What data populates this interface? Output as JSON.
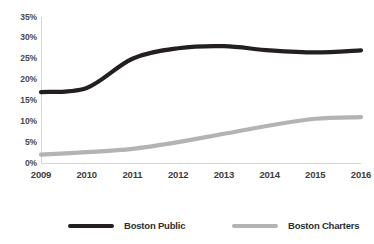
{
  "chart_data": {
    "type": "line",
    "title": "",
    "xlabel": "",
    "ylabel": "",
    "x": [
      2009,
      2010,
      2011,
      2012,
      2013,
      2014,
      2015,
      2016
    ],
    "categories": [
      "2009",
      "2010",
      "2011",
      "2012",
      "2013",
      "2014",
      "2015",
      "2016"
    ],
    "series": [
      {
        "name": "Boston Public",
        "color": "#231f20",
        "values": [
          17,
          18,
          25,
          27.5,
          28,
          27,
          26.5,
          27
        ]
      },
      {
        "name": "Boston Charters",
        "color": "#b3b3b3",
        "values": [
          2,
          2.6,
          3.4,
          5,
          7,
          9,
          10.6,
          11
        ]
      }
    ],
    "ylim": [
      0,
      35
    ],
    "ytick_values": [
      0,
      5,
      10,
      15,
      20,
      25,
      30,
      35
    ],
    "ytick_labels": [
      "0%",
      "5%",
      "10%",
      "15%",
      "20%",
      "25%",
      "30%",
      "35%"
    ],
    "xlim": [
      2009,
      2016
    ],
    "grid": false,
    "legend_position": "bottom"
  },
  "axes": {
    "y_ticks": [
      {
        "label": "35%",
        "value": 35
      },
      {
        "label": "30%",
        "value": 30
      },
      {
        "label": "25%",
        "value": 25
      },
      {
        "label": "20%",
        "value": 20
      },
      {
        "label": "15%",
        "value": 15
      },
      {
        "label": "10%",
        "value": 10
      },
      {
        "label": "5%",
        "value": 5
      },
      {
        "label": "0%",
        "value": 0
      }
    ],
    "x_ticks": [
      {
        "label": "2009",
        "value": 2009
      },
      {
        "label": "2010",
        "value": 2010
      },
      {
        "label": "2011",
        "value": 2011
      },
      {
        "label": "2012",
        "value": 2012
      },
      {
        "label": "2013",
        "value": 2013
      },
      {
        "label": "2014",
        "value": 2014
      },
      {
        "label": "2015",
        "value": 2015
      },
      {
        "label": "2016",
        "value": 2016
      }
    ]
  },
  "legend": {
    "entries": [
      {
        "label": "Boston Public",
        "color": "#231f20"
      },
      {
        "label": "Boston Charters",
        "color": "#b3b3b3"
      }
    ]
  },
  "title_sliver": {
    "text": ""
  }
}
